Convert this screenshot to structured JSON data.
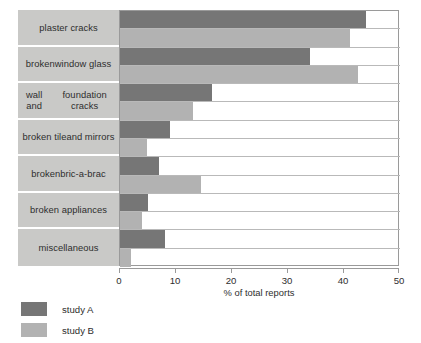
{
  "chart_data": {
    "type": "bar",
    "orientation": "horizontal",
    "title": "",
    "xlabel": "% of total reports",
    "ylabel": "",
    "xlim": [
      0,
      50
    ],
    "xticks": [
      0,
      10,
      20,
      30,
      40,
      50
    ],
    "xtick_labels": [
      "0",
      "10",
      "20",
      "30",
      "40",
      "50"
    ],
    "grid": true,
    "legend_position": "bottom-left",
    "categories": [
      "plaster cracks",
      "broken\nwindow glass",
      "wall and\nfoundation cracks",
      "broken tile\nand mirrors",
      "broken\nbric-a-brac",
      "broken appliances",
      "miscellaneous"
    ],
    "series": [
      {
        "name": "study A",
        "color": "#767676",
        "values": [
          44,
          34,
          16.5,
          9,
          7,
          5,
          8
        ]
      },
      {
        "name": "study B",
        "color": "#b2b2b2",
        "values": [
          41,
          42.5,
          13,
          4.8,
          14.5,
          4,
          2
        ]
      }
    ]
  },
  "axis": {
    "x_title": "% of total reports"
  },
  "legend": {
    "items": [
      {
        "label": "study A",
        "color": "#767676"
      },
      {
        "label": "study B",
        "color": "#b2b2b2"
      }
    ]
  },
  "colors": {
    "study_a": "#767676",
    "study_b": "#b2b2b2",
    "category_panel": "#c9c9c7",
    "gridline": "#b9b9b9",
    "axis": "#9a9a9a"
  }
}
